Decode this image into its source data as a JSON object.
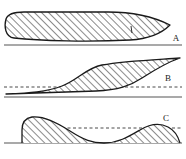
{
  "figure": {
    "title": "",
    "background_color": "#ffffff",
    "width": 186,
    "height": 159,
    "stroke_color": "#1a1a1a",
    "hatch_color": "#2b2b2b",
    "baseline_color": "#8c8c8c",
    "dashed_color": "#4a4a4a"
  },
  "panels": [
    {
      "id": "A",
      "label": "A",
      "label_x": 176,
      "label_y": 41,
      "description": "full thick lens tapering to a point at the right, hatched",
      "baseline": {
        "x1": 4,
        "y1": 45,
        "x2": 182,
        "y2": 45,
        "style": "solid"
      },
      "dashed_line": null,
      "outline_top": "M 14,38 C 5,37 4,26 6,19 C 8,13 16,12 24,12 L 108,12 C 130,12 152,16 170,25",
      "outline_bottom": "M 14,38 C 40,41 90,42 130,40 C 148,39 162,33 170,25",
      "peak_height_px": 33
    },
    {
      "id": "B",
      "label": "B",
      "label_x": 168,
      "label_y": 81,
      "description": "sigmoid lens between two S-curves crossing a dashed midline",
      "baseline": {
        "x1": 4,
        "y1": 97,
        "x2": 182,
        "y2": 97,
        "style": "solid"
      },
      "dashed_line": {
        "x1": 4,
        "y1": 87,
        "x2": 182,
        "y2": 87,
        "style": "dashed"
      },
      "outline_upper": "M 6,94 C 30,93 46,92 62,86 C 78,80 86,68 102,65 C 124,61 150,60 180,58",
      "outline_lower": "M 6,94 C 40,93 70,92 96,91 C 118,90 130,86 142,78 C 156,69 168,62 180,58",
      "peak_height_px": 39
    },
    {
      "id": "C",
      "label": "C",
      "label_x": 166,
      "label_y": 121,
      "description": "wave descending from left to a trough then rising to a right hump, hatched above baseline",
      "baseline": {
        "x1": 4,
        "y1": 143,
        "x2": 182,
        "y2": 143,
        "style": "solid"
      },
      "dashed_line": {
        "x1": 40,
        "y1": 128,
        "x2": 182,
        "y2": 128,
        "style": "dashed"
      },
      "outline_top": "M 22,130 C 22,122 26,118 32,117 C 44,116 56,122 70,131 C 84,140 92,143 104,143 C 118,143 128,137 140,130 C 150,124 160,123 168,127 C 174,130 178,136 180,143",
      "peak_height_px": 26
    }
  ]
}
